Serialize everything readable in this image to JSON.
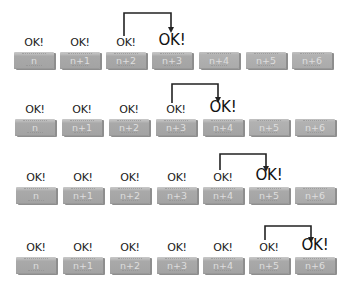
{
  "diagram": {
    "type": "sliding-acknowledgement-sequence",
    "ok_label": "OK!",
    "colors": {
      "block": "#a8a8a8",
      "block_text": "#dedede",
      "arrow": "#222222",
      "text": "#222222",
      "background": "#ffffff"
    },
    "rows": [
      {
        "blocks": [
          {
            "label": "n",
            "ok": "OK!",
            "state": "acked"
          },
          {
            "label": "n+1",
            "ok": "OK!",
            "state": "acked"
          },
          {
            "label": "n+2",
            "ok": "OK!",
            "state": "acked"
          },
          {
            "label": "n+3",
            "ok": "OK!",
            "state": "new-ack"
          },
          {
            "label": "n+4",
            "ok": "",
            "state": "pending"
          },
          {
            "label": "n+5",
            "ok": "",
            "state": "pending"
          },
          {
            "label": "n+6",
            "ok": "",
            "state": "pending"
          }
        ],
        "arrow": {
          "from": "n+2",
          "to": "n+3"
        }
      },
      {
        "blocks": [
          {
            "label": "n",
            "ok": "OK!",
            "state": "acked"
          },
          {
            "label": "n+1",
            "ok": "OK!",
            "state": "acked"
          },
          {
            "label": "n+2",
            "ok": "OK!",
            "state": "acked"
          },
          {
            "label": "n+3",
            "ok": "OK!",
            "state": "acked"
          },
          {
            "label": "n+4",
            "ok": "OK!",
            "state": "new-ack"
          },
          {
            "label": "n+5",
            "ok": "",
            "state": "pending"
          },
          {
            "label": "n+6",
            "ok": "",
            "state": "pending"
          }
        ],
        "arrow": {
          "from": "n+3",
          "to": "n+4"
        }
      },
      {
        "blocks": [
          {
            "label": "n",
            "ok": "OK!",
            "state": "acked"
          },
          {
            "label": "n+1",
            "ok": "OK!",
            "state": "acked"
          },
          {
            "label": "n+2",
            "ok": "OK!",
            "state": "acked"
          },
          {
            "label": "n+3",
            "ok": "OK!",
            "state": "acked"
          },
          {
            "label": "n+4",
            "ok": "OK!",
            "state": "acked"
          },
          {
            "label": "n+5",
            "ok": "OK!",
            "state": "new-ack"
          },
          {
            "label": "n+6",
            "ok": "",
            "state": "pending"
          }
        ],
        "arrow": {
          "from": "n+4",
          "to": "n+5"
        }
      },
      {
        "blocks": [
          {
            "label": "n",
            "ok": "OK!",
            "state": "acked"
          },
          {
            "label": "n+1",
            "ok": "OK!",
            "state": "acked"
          },
          {
            "label": "n+2",
            "ok": "OK!",
            "state": "acked"
          },
          {
            "label": "n+3",
            "ok": "OK!",
            "state": "acked"
          },
          {
            "label": "n+4",
            "ok": "OK!",
            "state": "acked"
          },
          {
            "label": "n+5",
            "ok": "OK!",
            "state": "acked"
          },
          {
            "label": "n+6",
            "ok": "OK!",
            "state": "new-ack"
          }
        ],
        "arrow": {
          "from": "n+5",
          "to": "n+6"
        }
      }
    ]
  }
}
